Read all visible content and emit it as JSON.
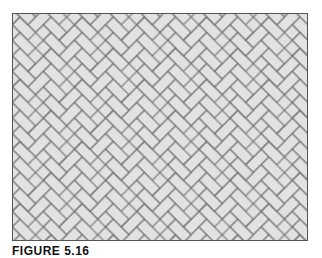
{
  "figure": {
    "pattern": "herringbone-45",
    "brick_fill": "#e4e4e4",
    "joint_color": "#6e6e6e",
    "frame_color": "#555555"
  },
  "caption": {
    "label": "FIGURE 5.16"
  }
}
